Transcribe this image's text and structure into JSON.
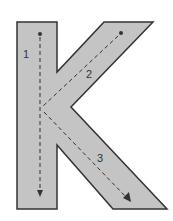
{
  "letter": "K",
  "colors": {
    "fill": "#c4c4c4",
    "outline": "#333333",
    "guide": "#333333",
    "background": "#ffffff"
  },
  "strokes": [
    {
      "number": "1",
      "direction": "down"
    },
    {
      "number": "2",
      "direction": "down-left"
    },
    {
      "number": "3",
      "direction": "down-right"
    }
  ]
}
